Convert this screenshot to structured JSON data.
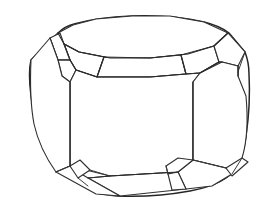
{
  "figure": {
    "style": "black and white wireframe outline drawing",
    "background_color": "#ffffff",
    "line_color": "#2b2b2b",
    "fill_color": "#ffffff",
    "line_width_px": 1.15,
    "canvas": {
      "width": 274,
      "height": 209
    },
    "view": "three-quarter perspective from slightly above",
    "labels": [],
    "annotations": [],
    "facet_count_visible": 21,
    "geometry": {
      "table": {
        "name": "table-facet",
        "points": "58,33 73,25 96,19 132,16 170,16 204,22 228,33 214,46 188,54 150,58 110,58 79,52 64,44"
      },
      "crown_band": {
        "name": "crown-girdle-band",
        "points": "64,44 79,52 110,58 150,58 188,54 214,46 219,62 196,72 150,77 104,77 76,70 70,60"
      },
      "girdle_left": {
        "name": "girdle-left-facet",
        "points": "50,38 60,33 72,48 58,60"
      },
      "girdle_right": {
        "name": "girdle-right-facet",
        "points": "228,33 245,52 238,72 222,62"
      },
      "pavilion_front": {
        "name": "pavilion-front-face",
        "points": "70,82 104,77 150,77 193,80 193,160 178,172 110,176 70,166"
      },
      "bottom_band": {
        "name": "bottom-girdle-band",
        "points": "70,166 110,176 178,172 190,190 120,196 88,186"
      },
      "left_side": {
        "name": "left-side-face",
        "points": "32,60 50,38 58,60 70,82 70,166 56,172 34,140"
      },
      "right_side": {
        "name": "right-side-face",
        "points": "238,72 246,100 244,140 226,168 193,160 193,80 222,62"
      }
    }
  }
}
